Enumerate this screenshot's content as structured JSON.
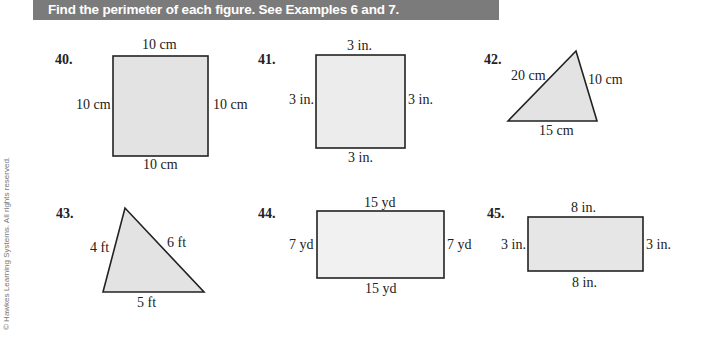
{
  "header": {
    "instruction": "Find the perimeter of each figure.  See Examples 6 and 7.",
    "bar_color": "#7b7b7b"
  },
  "figure_fill": "#e6e6e6",
  "problems": [
    {
      "number": "40.",
      "shape": "square",
      "sides": {
        "top": "10 cm",
        "left": "10 cm",
        "right": "10 cm",
        "bottom": "10 cm"
      }
    },
    {
      "number": "41.",
      "shape": "square",
      "sides": {
        "top": "3 in.",
        "left": "3 in.",
        "right": "3 in.",
        "bottom": "3 in."
      }
    },
    {
      "number": "42.",
      "shape": "triangle",
      "sides": {
        "left": "20 cm",
        "right": "10 cm",
        "bottom": "15 cm"
      }
    },
    {
      "number": "43.",
      "shape": "triangle",
      "sides": {
        "left": "4 ft",
        "right": "6 ft",
        "bottom": "5 ft"
      }
    },
    {
      "number": "44.",
      "shape": "rectangle",
      "sides": {
        "top": "15 yd",
        "left": "7 yd",
        "right": "7 yd",
        "bottom": "15 yd"
      }
    },
    {
      "number": "45.",
      "shape": "rectangle",
      "sides": {
        "top": "8 in.",
        "left": "3 in.",
        "right": "3 in.",
        "bottom": "8 in."
      }
    }
  ],
  "copyright": "© Hawkes Learning Systems.  All rights reserved."
}
